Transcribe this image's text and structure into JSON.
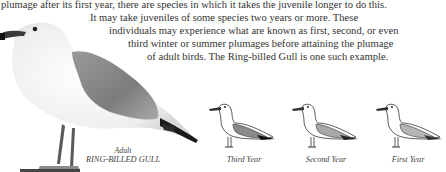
{
  "text": {
    "lines": [
      "plumage after its first year, there are species in which it takes the juvenile longer to do this.",
      "It may take juveniles of some species two years or more. These",
      "individuals may experience what are known as first, second, or even",
      "third winter or summer plumages before attaining the plumage",
      "of adult birds. The Ring-billed Gull is one such example."
    ]
  },
  "figures": {
    "adult": {
      "caption_top": "Adult",
      "caption_bottom": "RING-BILLED GULL",
      "icon": "gull-photo-icon"
    },
    "stages": [
      {
        "label": "Third Year",
        "icon": "gull-illustration-icon"
      },
      {
        "label": "Second Year",
        "icon": "gull-illustration-icon"
      },
      {
        "label": "First Year",
        "icon": "gull-illustration-icon"
      }
    ]
  }
}
